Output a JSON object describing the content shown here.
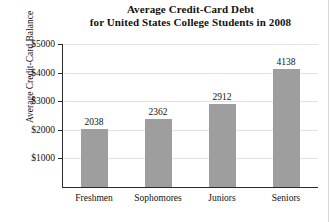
{
  "chart_data": {
    "type": "bar",
    "title": "Average Credit-Card Debt for United States College Students in 2008",
    "title_lines": [
      "Average Credit-Card Debt",
      "for United States College Students in 2008"
    ],
    "xlabel": "",
    "ylabel": "Average Credit-Card Balance",
    "categories": [
      "Freshmen",
      "Sophomores",
      "Juniors",
      "Seniors"
    ],
    "values": [
      2038,
      2362,
      2912,
      4138
    ],
    "value_labels": [
      "2038",
      "2362",
      "2912",
      "4138"
    ],
    "ylim": [
      0,
      5000
    ],
    "yticks": [
      1000,
      2000,
      3000,
      4000,
      5000
    ],
    "ytick_labels": [
      "$1000",
      "$2000",
      "$3000",
      "$4000",
      "$5000"
    ],
    "grid": true,
    "legend": "none",
    "bar_color": "#9e9e9e",
    "axis_color": "#2b2b2b",
    "grid_color": "#e2e2e2"
  }
}
